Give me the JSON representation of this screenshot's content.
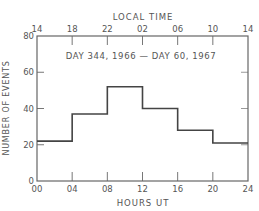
{
  "chart_data": {
    "type": "bar",
    "subtype": "step-histogram",
    "title": "DAY 344, 1966 — DAY 60, 1967",
    "xlabel": "HOURS UT",
    "ylabel": "NUMBER OF EVENTS",
    "top_xlabel": "LOCAL TIME",
    "xlim": [
      0,
      24
    ],
    "ylim": [
      0,
      80
    ],
    "x_ticks": [
      "00",
      "04",
      "08",
      "12",
      "16",
      "20",
      "24"
    ],
    "top_x_ticks": [
      "14",
      "18",
      "22",
      "02",
      "06",
      "10",
      "14"
    ],
    "y_ticks": [
      "0",
      "20",
      "40",
      "60",
      "80"
    ],
    "grid": false,
    "legend": null,
    "categories": [
      "00-04",
      "04-08",
      "08-12",
      "12-16",
      "16-20",
      "20-24"
    ],
    "bin_edges": [
      0,
      4,
      8,
      12,
      16,
      20,
      24
    ],
    "values": [
      22,
      37,
      52,
      40,
      28,
      21
    ]
  },
  "colors": {
    "line": "#444444",
    "axis": "#666666",
    "text": "#555555"
  }
}
